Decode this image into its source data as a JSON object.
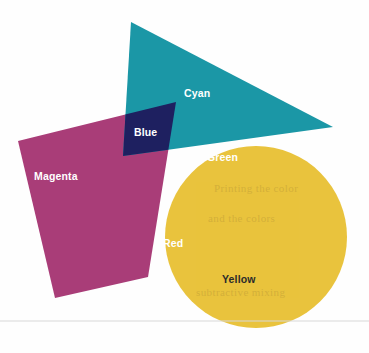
{
  "figure": {
    "background_color": "#fefefe",
    "width": 369,
    "height": 353,
    "labels": {
      "cyan": "Cyan",
      "magenta": "Magenta",
      "yellow": "Yellow",
      "blue": "Blue",
      "green": "Green",
      "red": "Red"
    },
    "colors": {
      "cyan": "#1b97a6",
      "magenta": "#a93d78",
      "yellow": "#e9c33d",
      "blue": "#1e2060",
      "green": "#2d7a4c",
      "red": "#d93b1e",
      "black": "#0b0b0b",
      "label_light": "#ffffff",
      "label_dark": "#2b2b2b",
      "paper_line": "#d8d8d8"
    },
    "shapes": [
      {
        "name": "cyan-triangle",
        "kind": "triangle",
        "color_key": "cyan",
        "label_key": "cyan"
      },
      {
        "name": "magenta-square",
        "kind": "rotated-square",
        "color_key": "magenta",
        "label_key": "magenta"
      },
      {
        "name": "yellow-circle",
        "kind": "circle",
        "color_key": "yellow",
        "label_key": "yellow"
      }
    ],
    "overlaps": [
      {
        "name": "blue-overlap",
        "parents": [
          "cyan",
          "magenta"
        ],
        "color_key": "blue",
        "label_key": "blue"
      },
      {
        "name": "green-overlap",
        "parents": [
          "cyan",
          "yellow"
        ],
        "color_key": "green",
        "label_key": "green"
      },
      {
        "name": "red-overlap",
        "parents": [
          "magenta",
          "yellow"
        ],
        "color_key": "red",
        "label_key": "red"
      },
      {
        "name": "black-overlap",
        "parents": [
          "cyan",
          "magenta",
          "yellow"
        ],
        "color_key": "black",
        "label_key": null
      }
    ],
    "ghost_text": [
      "Printing the color",
      "and the colors",
      "subtractive mixing"
    ]
  }
}
